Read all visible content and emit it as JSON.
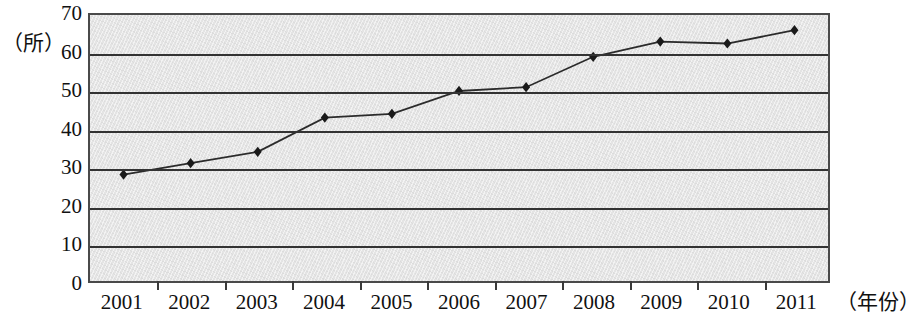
{
  "chart_data": {
    "type": "line",
    "title": "",
    "subtitle": "",
    "xlabel": "（年份）",
    "ylabel": "（所）",
    "categories": [
      "2001",
      "2002",
      "2003",
      "2004",
      "2005",
      "2006",
      "2007",
      "2008",
      "2009",
      "2010",
      "2011"
    ],
    "values": [
      28,
      31,
      34,
      43,
      44,
      50,
      51,
      59,
      63,
      62.5,
      66
    ],
    "series": [
      {
        "name": "",
        "values": [
          28,
          31,
          34,
          43,
          44,
          50,
          51,
          59,
          63,
          62.5,
          66
        ]
      }
    ],
    "ylim": [
      0,
      70
    ],
    "yticks": [
      0,
      10,
      20,
      30,
      40,
      50,
      60,
      70
    ],
    "ytick_labels": [
      "0",
      "10",
      "20",
      "30",
      "40",
      "50",
      "60",
      "70"
    ],
    "grid": true,
    "legend": false,
    "legend_position": "none",
    "marker": "diamond",
    "line_color": "#2b2b2b",
    "marker_color": "#1a1a1a",
    "plot_background": "#e4e4e4",
    "axis_color": "#4a4a4a",
    "gridline_color": "#333333"
  }
}
